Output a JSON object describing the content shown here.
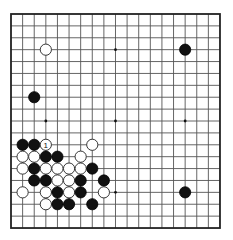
{
  "board": {
    "size": 19,
    "origin_x": 11,
    "origin_y": 14,
    "spacing_x": 11.61,
    "spacing_y": 11.89,
    "stone_radius": 5.6,
    "colors": {
      "black": "#111111",
      "white": "#ffffff",
      "line": "#555555",
      "border": "#222222"
    },
    "hoshi": [
      {
        "col": 3,
        "row": 3
      },
      {
        "col": 9,
        "row": 3
      },
      {
        "col": 15,
        "row": 3
      },
      {
        "col": 3,
        "row": 9
      },
      {
        "col": 9,
        "row": 9
      },
      {
        "col": 15,
        "row": 9
      },
      {
        "col": 3,
        "row": 15
      },
      {
        "col": 9,
        "row": 15
      },
      {
        "col": 15,
        "row": 15
      }
    ],
    "stones": [
      {
        "color": "white",
        "col": 3,
        "row": 3
      },
      {
        "color": "black",
        "col": 15,
        "row": 3
      },
      {
        "color": "black",
        "col": 2,
        "row": 7
      },
      {
        "color": "black",
        "col": 1,
        "row": 11
      },
      {
        "color": "black",
        "col": 2,
        "row": 11
      },
      {
        "color": "white",
        "col": 3,
        "row": 11,
        "label": "1"
      },
      {
        "color": "white",
        "col": 7,
        "row": 11
      },
      {
        "color": "white",
        "col": 1,
        "row": 12
      },
      {
        "color": "white",
        "col": 2,
        "row": 12
      },
      {
        "color": "black",
        "col": 3,
        "row": 12
      },
      {
        "color": "black",
        "col": 4,
        "row": 12
      },
      {
        "color": "white",
        "col": 6,
        "row": 12
      },
      {
        "color": "white",
        "col": 1,
        "row": 13
      },
      {
        "color": "black",
        "col": 2,
        "row": 13
      },
      {
        "color": "white",
        "col": 3,
        "row": 13
      },
      {
        "color": "white",
        "col": 4,
        "row": 13
      },
      {
        "color": "white",
        "col": 5,
        "row": 13
      },
      {
        "color": "white",
        "col": 6,
        "row": 13
      },
      {
        "color": "black",
        "col": 7,
        "row": 13
      },
      {
        "color": "black",
        "col": 2,
        "row": 14
      },
      {
        "color": "black",
        "col": 3,
        "row": 14
      },
      {
        "color": "white",
        "col": 4,
        "row": 14
      },
      {
        "color": "white",
        "col": 5,
        "row": 14
      },
      {
        "color": "black",
        "col": 6,
        "row": 14
      },
      {
        "color": "black",
        "col": 8,
        "row": 14
      },
      {
        "color": "white",
        "col": 1,
        "row": 15
      },
      {
        "color": "white",
        "col": 3,
        "row": 15
      },
      {
        "color": "black",
        "col": 4,
        "row": 15
      },
      {
        "color": "white",
        "col": 5,
        "row": 15
      },
      {
        "color": "black",
        "col": 6,
        "row": 15
      },
      {
        "color": "white",
        "col": 8,
        "row": 15
      },
      {
        "color": "black",
        "col": 15,
        "row": 15
      },
      {
        "color": "white",
        "col": 3,
        "row": 16
      },
      {
        "color": "black",
        "col": 4,
        "row": 16
      },
      {
        "color": "black",
        "col": 5,
        "row": 16
      },
      {
        "color": "black",
        "col": 7,
        "row": 16
      }
    ]
  }
}
